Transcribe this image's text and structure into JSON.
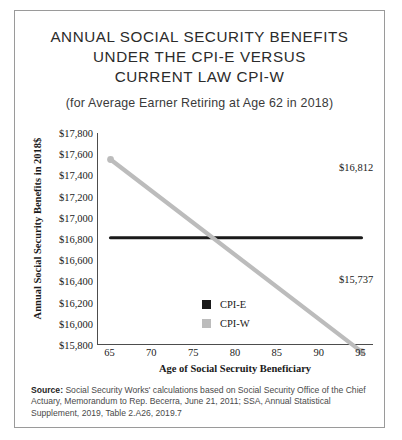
{
  "card": {
    "title_lines": [
      "ANNUAL SOCIAL SECURITY BENEFITS",
      "UNDER THE CPI-E VERSUS",
      "CURRENT LAW CPI-W"
    ],
    "subtitle": "(for Average Earner Retiring at Age 62 in 2018)",
    "source_prefix": "Source:",
    "source_text": " Social Security Works' calculations based on Social Security Office of the Chief Actuary, Memorandum to Rep. Becerra, June 21, 2011; SSA, Annual Statistical Supplement, 2019, Table 2.A26, 2019.7"
  },
  "colors": {
    "cpi_e": "#1a1a1a",
    "cpi_w": "#bcbcbc",
    "axis": "#4d4d4d",
    "border": "#9a9a9a",
    "text": "#1a1a1a"
  },
  "chart_data": {
    "type": "line",
    "title": "ANNUAL SOCIAL SECURITY BENEFITS UNDER THE CPI-E VERSUS CURRENT LAW CPI-W",
    "subtitle": "(for Average Earner Retiring at Age 62 in 2018)",
    "xlabel": "Age of Social Secruity Beneficiary",
    "ylabel": "Annual Social Security Benefits in 2018$",
    "x": [
      65,
      95
    ],
    "xlim": [
      63.5,
      96.5
    ],
    "ylim": [
      15800,
      17800
    ],
    "xticks": [
      65,
      70,
      75,
      80,
      85,
      90,
      95
    ],
    "xtick_labels": [
      "65",
      "70",
      "75",
      "80",
      "85",
      "90",
      "95"
    ],
    "yticks": [
      15800,
      16000,
      16200,
      16400,
      16600,
      16800,
      17000,
      17200,
      17400,
      17600,
      17800
    ],
    "ytick_labels": [
      "$15,800",
      "$16,000",
      "$16,200",
      "$16,400",
      "$16,600",
      "$16,800",
      "$17,000",
      "$17,200",
      "$17,400",
      "$17,600",
      "$17,800"
    ],
    "grid": false,
    "legend_position": "center-left-inside",
    "series": [
      {
        "name": "CPI-E",
        "color": "#1a1a1a",
        "values": [
          16812,
          16812
        ],
        "markers": false,
        "width": 3.2
      },
      {
        "name": "CPI-W",
        "color": "#bcbcbc",
        "values": [
          17550,
          15737
        ],
        "markers": true,
        "width": 4.2
      }
    ],
    "annotations": [
      {
        "label": "$16,812",
        "series": "CPI-E",
        "x": 95,
        "y": 16812
      },
      {
        "label": "$15,737",
        "series": "CPI-W",
        "x": 95,
        "y": 15737
      }
    ]
  }
}
